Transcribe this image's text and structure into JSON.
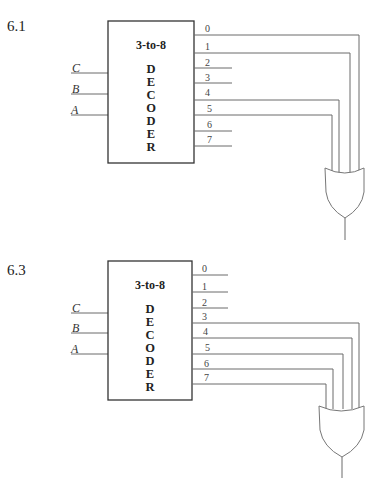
{
  "figures": [
    {
      "problem_label": "6.1",
      "decoder_title": "3-to-8",
      "decoder_letters": [
        "D",
        "E",
        "C",
        "O",
        "D",
        "E",
        "R"
      ],
      "inputs": [
        "C",
        "B",
        "A"
      ],
      "outputs": [
        "0",
        "1",
        "2",
        "3",
        "4",
        "5",
        "6",
        "7"
      ],
      "or_gate_inputs": [
        "0",
        "1",
        "4",
        "5"
      ],
      "gate": "OR"
    },
    {
      "problem_label": "6.3",
      "decoder_title": "3-to-8",
      "decoder_letters": [
        "D",
        "E",
        "C",
        "O",
        "D",
        "E",
        "R"
      ],
      "inputs": [
        "C",
        "B",
        "A"
      ],
      "outputs": [
        "0",
        "1",
        "2",
        "3",
        "4",
        "5",
        "6",
        "7"
      ],
      "or_gate_inputs": [
        "3",
        "4",
        "5",
        "6",
        "7"
      ],
      "gate": "OR"
    }
  ]
}
